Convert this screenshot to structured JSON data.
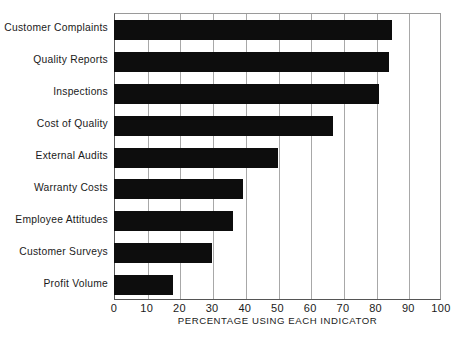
{
  "chart_data": {
    "type": "bar",
    "orientation": "horizontal",
    "title": "",
    "xlabel": "PERCENTAGE USING EACH INDICATOR",
    "ylabel": "",
    "xlim": [
      0,
      100
    ],
    "xticks": [
      0,
      10,
      20,
      30,
      40,
      50,
      60,
      70,
      80,
      90,
      100
    ],
    "xtick_labels": [
      "0",
      "10",
      "20",
      "30",
      "40",
      "50",
      "60",
      "70",
      "80",
      "90",
      "100"
    ],
    "grid": "vertical",
    "legend": "none",
    "bar_color": "#0d0d0d",
    "gridline_color": "#a8a8a8",
    "axis_color": "#555555",
    "background_color": "#ffffff",
    "categories": [
      "Customer Complaints",
      "Quality Reports",
      "Inspections",
      "Cost of Quality",
      "External Audits",
      "Warranty Costs",
      "Employee Attitudes",
      "Customer Surveys",
      "Profit Volume"
    ],
    "values": [
      85,
      84,
      81,
      67,
      50,
      39.5,
      36.5,
      30,
      18
    ]
  }
}
